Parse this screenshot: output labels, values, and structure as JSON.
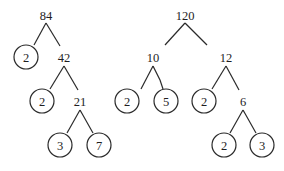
{
  "diagram": {
    "type": "factor-trees",
    "colors": {
      "ink": "#2a2a2a",
      "background": "#ffffff"
    },
    "trees": [
      {
        "root": "84",
        "nodes": [
          {
            "id": "n84",
            "label": "84",
            "x": 46,
            "y": 15,
            "prime": false
          },
          {
            "id": "n84_2",
            "label": "2",
            "x": 26,
            "y": 57,
            "prime": true
          },
          {
            "id": "n42",
            "label": "42",
            "x": 64,
            "y": 57,
            "prime": false
          },
          {
            "id": "n42_2",
            "label": "2",
            "x": 42,
            "y": 101,
            "prime": true
          },
          {
            "id": "n21",
            "label": "21",
            "x": 80,
            "y": 101,
            "prime": false
          },
          {
            "id": "n21_3",
            "label": "3",
            "x": 60,
            "y": 145,
            "prime": true
          },
          {
            "id": "n21_7",
            "label": "7",
            "x": 99,
            "y": 145,
            "prime": true
          }
        ],
        "edges": [
          {
            "x1": 46,
            "y1": 23,
            "x2": 34,
            "y2": 45
          },
          {
            "x1": 46,
            "y1": 23,
            "x2": 60,
            "y2": 46
          },
          {
            "x1": 64,
            "y1": 66,
            "x2": 50,
            "y2": 89
          },
          {
            "x1": 64,
            "y1": 66,
            "x2": 78,
            "y2": 90
          },
          {
            "x1": 80,
            "y1": 110,
            "x2": 67,
            "y2": 133
          },
          {
            "x1": 80,
            "y1": 110,
            "x2": 93,
            "y2": 133
          }
        ]
      },
      {
        "root": "120",
        "nodes": [
          {
            "id": "n120",
            "label": "120",
            "x": 185,
            "y": 15,
            "prime": false
          },
          {
            "id": "n10",
            "label": "10",
            "x": 153,
            "y": 57,
            "prime": false
          },
          {
            "id": "n10_2",
            "label": "2",
            "x": 127,
            "y": 101,
            "prime": true
          },
          {
            "id": "n10_5",
            "label": "5",
            "x": 166,
            "y": 101,
            "prime": true
          },
          {
            "id": "n12",
            "label": "12",
            "x": 226,
            "y": 57,
            "prime": false
          },
          {
            "id": "n12_2",
            "label": "2",
            "x": 204,
            "y": 101,
            "prime": true
          },
          {
            "id": "n6",
            "label": "6",
            "x": 243,
            "y": 101,
            "prime": false
          },
          {
            "id": "n6_2",
            "label": "2",
            "x": 224,
            "y": 145,
            "prime": true
          },
          {
            "id": "n6_3",
            "label": "3",
            "x": 262,
            "y": 145,
            "prime": true
          }
        ],
        "edges": [
          {
            "x1": 185,
            "y1": 23,
            "x2": 165,
            "y2": 45
          },
          {
            "x1": 185,
            "y1": 23,
            "x2": 207,
            "y2": 45
          },
          {
            "x1": 153,
            "y1": 66,
            "x2": 141,
            "y2": 89
          },
          {
            "x1": 153,
            "y1": 66,
            "x2": 160,
            "y2": 80
          },
          {
            "x1": 160,
            "y1": 80,
            "x2": 163,
            "y2": 89
          },
          {
            "x1": 226,
            "y1": 66,
            "x2": 212,
            "y2": 89
          },
          {
            "x1": 226,
            "y1": 66,
            "x2": 239,
            "y2": 90
          },
          {
            "x1": 243,
            "y1": 110,
            "x2": 230,
            "y2": 133
          },
          {
            "x1": 243,
            "y1": 110,
            "x2": 256,
            "y2": 133
          }
        ]
      }
    ],
    "circle_radius": 12
  }
}
